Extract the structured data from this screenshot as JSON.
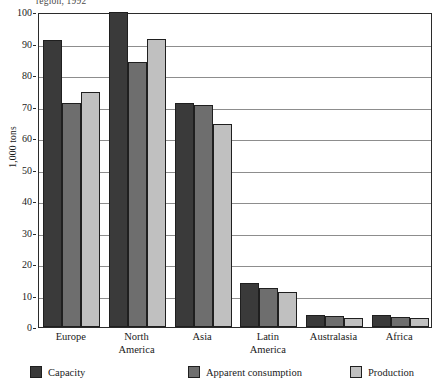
{
  "caption_fragment": "region, 1992",
  "chart_data": {
    "type": "bar",
    "title": "region, 1992",
    "xlabel": "",
    "ylabel": "1,000 tons",
    "ylim": [
      0,
      100
    ],
    "ytick_step": 10,
    "yticks": [
      0,
      10,
      20,
      30,
      40,
      50,
      60,
      70,
      80,
      90,
      100
    ],
    "ytick_labels": [
      "0",
      "10",
      "20",
      "30",
      "40",
      "50",
      "60",
      "70",
      "80",
      "90",
      "100"
    ],
    "grid": true,
    "legend_position": "bottom",
    "categories": [
      "Europe",
      "North America",
      "Asia",
      "Latin America",
      "Australasia",
      "Africa"
    ],
    "category_lines": [
      [
        "Europe"
      ],
      [
        "North",
        "America"
      ],
      [
        "Asia"
      ],
      [
        "Latin",
        "America"
      ],
      [
        "Australasia"
      ],
      [
        "Africa"
      ]
    ],
    "series": [
      {
        "name": "Capacity",
        "color": "#3a3a3a",
        "values": [
          91,
          100,
          71,
          14,
          3.8,
          3.8
        ]
      },
      {
        "name": "Apparent consumption",
        "color": "#6e6e6e",
        "values": [
          71,
          84,
          70.5,
          12.5,
          3.5,
          3.2
        ]
      },
      {
        "name": "Production",
        "color": "#c0c0c0",
        "values": [
          74.5,
          91.5,
          64.5,
          11,
          3,
          2.8
        ]
      }
    ]
  },
  "colors": {
    "capacity": "#3a3a3a",
    "apparent_consumption": "#6e6e6e",
    "production": "#c0c0c0",
    "axis": "#2b2b2b",
    "gridline": "#8d8d8d",
    "background": "#ffffff"
  }
}
